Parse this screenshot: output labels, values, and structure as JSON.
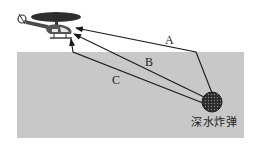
{
  "diagram": {
    "type": "physics-sound-propagation",
    "paths": [
      {
        "id": "A",
        "label": "A",
        "description": "from bomb up to water surface then through air to helicopter"
      },
      {
        "id": "B",
        "label": "B",
        "description": "straight line from bomb to helicopter"
      },
      {
        "id": "C",
        "label": "C",
        "description": "through water to point below helicopter, then up"
      }
    ],
    "objects": {
      "source": {
        "label": "深水炸弹",
        "icon": "depth-charge-icon"
      },
      "receiver": {
        "icon": "helicopter-icon"
      }
    },
    "colors": {
      "water": "#c8c8c8",
      "line": "#1a1a1a",
      "helicopter_body": "#3a3a3a",
      "bomb": "#2a2a2a",
      "background": "#ffffff"
    }
  }
}
